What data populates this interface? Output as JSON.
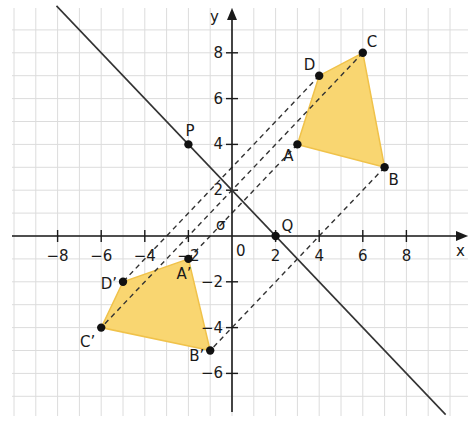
{
  "diagram": {
    "type": "coordinate-geometry",
    "axes": {
      "x_label": "x",
      "y_label": "y",
      "origin_label": "0",
      "x_ticks": [
        {
          "value": -8,
          "label": "−8"
        },
        {
          "value": -6,
          "label": "−6"
        },
        {
          "value": -4,
          "label": "−4"
        },
        {
          "value": -2,
          "label": "−2"
        },
        {
          "value": 2,
          "label": "2"
        },
        {
          "value": 4,
          "label": "4"
        },
        {
          "value": 6,
          "label": "6"
        },
        {
          "value": 8,
          "label": "8"
        }
      ],
      "y_ticks": [
        {
          "value": 8,
          "label": "8"
        },
        {
          "value": 6,
          "label": "6"
        },
        {
          "value": 4,
          "label": "4"
        },
        {
          "value": 2,
          "label": "2"
        },
        {
          "value": -2,
          "label": "−2"
        },
        {
          "value": -4,
          "label": "−4"
        },
        {
          "value": -6,
          "label": "−6"
        }
      ],
      "x_range": [
        -10,
        10
      ],
      "y_range": [
        -8,
        10
      ],
      "grid": true
    },
    "line": {
      "label": "σ",
      "equation": "y = -x + 2",
      "through": [
        "P",
        "Q"
      ]
    },
    "points": {
      "P": {
        "label": "P",
        "x": -2,
        "y": 4
      },
      "Q": {
        "label": "Q",
        "x": 2,
        "y": 0
      }
    },
    "quadrilateral_original": {
      "vertices": [
        {
          "label": "A",
          "x": 3,
          "y": 4
        },
        {
          "label": "B",
          "x": 7,
          "y": 3
        },
        {
          "label": "C",
          "x": 6,
          "y": 8
        },
        {
          "label": "D",
          "x": 4,
          "y": 7
        }
      ]
    },
    "quadrilateral_image": {
      "vertices": [
        {
          "label": "A’",
          "x": -2,
          "y": -1
        },
        {
          "label": "B’",
          "x": -1,
          "y": -5
        },
        {
          "label": "C’",
          "x": -6,
          "y": -4
        },
        {
          "label": "D’",
          "x": -5,
          "y": -2
        }
      ]
    },
    "dashed_connectors": [
      [
        "A",
        "A’"
      ],
      [
        "B",
        "B’"
      ],
      [
        "C",
        "C’"
      ],
      [
        "D",
        "D’"
      ]
    ],
    "colors": {
      "fill": "#F9D671",
      "fill_stroke": "#F0C24A",
      "grid": "#dcdcdc",
      "ink": "#1a1a1a"
    }
  }
}
